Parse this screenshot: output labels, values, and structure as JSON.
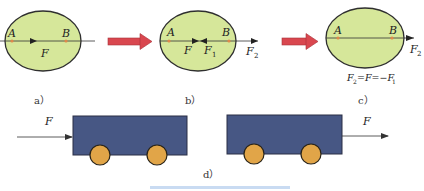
{
  "colors": {
    "ellipse_fill": "#d6e79a",
    "ellipse_stroke": "#2f2f2f",
    "point_marker": "#e0884a",
    "transition_arrow": "#d9474f",
    "cart_body": "#475784",
    "wheel_fill": "#e1a548",
    "line": "#333333",
    "bottom_bar": "#c9dbf2"
  },
  "panels": {
    "a": {
      "caption": "a）",
      "point_a": "A",
      "point_b": "B",
      "force": "F"
    },
    "b": {
      "caption": "b）",
      "point_a": "A",
      "point_b": "B",
      "force": "F",
      "force1_base": "F",
      "force1_sub": "1",
      "force2_base": "F",
      "force2_sub": "2"
    },
    "c": {
      "caption": "c）",
      "point_a": "A",
      "point_b": "B",
      "force2_base": "F",
      "force2_sub": "2",
      "equation": {
        "part1_base": "F",
        "part1_sub": "2",
        "part2": "=F=−F",
        "part3_sub": "1"
      }
    },
    "d": {
      "caption": "d）",
      "left_cart_force": "F",
      "right_cart_force": "F"
    }
  }
}
